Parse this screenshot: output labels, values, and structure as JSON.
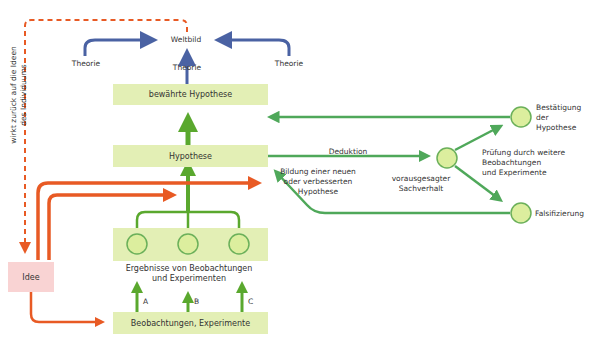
{
  "diagram": {
    "colors": {
      "green_box": "#e3efb5",
      "green_line": "#4fa85a",
      "green_bright": "#5aa82e",
      "blue": "#4a62a3",
      "orange": "#e85a24",
      "pink_box": "#f9d3d3",
      "circle_fill": "#dcee9e",
      "circle_stroke": "#6bb05a"
    },
    "top": {
      "weltbild": "Weltbild",
      "theorie_left": "Theorie",
      "theorie_center": "Theorie",
      "theorie_right": "Theorie"
    },
    "boxes": {
      "bewaehrte_hypothese": "bewährte Hypothese",
      "hypothese": "Hypothese",
      "beobachtungen": "Beobachtungen, Experimente",
      "idee": "Idee"
    },
    "ergebnisse": {
      "line1": "Ergebnisse von Beobachtungen",
      "line2": "und Experimenten"
    },
    "arrow_labels": {
      "a": "A",
      "b": "B",
      "c": "C"
    },
    "feedback": {
      "line1": "wirkt zurück auf die Ideen",
      "line2": "des Individuums"
    },
    "deduktion": "Deduktion",
    "bildung": {
      "line1": "Bildung einer neuen",
      "line2": "oder verbesserten",
      "line3": "Hypothese"
    },
    "sachverhalt": {
      "line1": "vorausgesagter",
      "line2": "Sachverhalt"
    },
    "pruefung": {
      "line1": "Prüfung durch weitere",
      "line2": "Beobachtungen",
      "line3": "und Experimente"
    },
    "bestaetigung": {
      "line1": "Bestätigung",
      "line2": "der",
      "line3": "Hypothese"
    },
    "falsifizierung": "Falsifizierung"
  }
}
